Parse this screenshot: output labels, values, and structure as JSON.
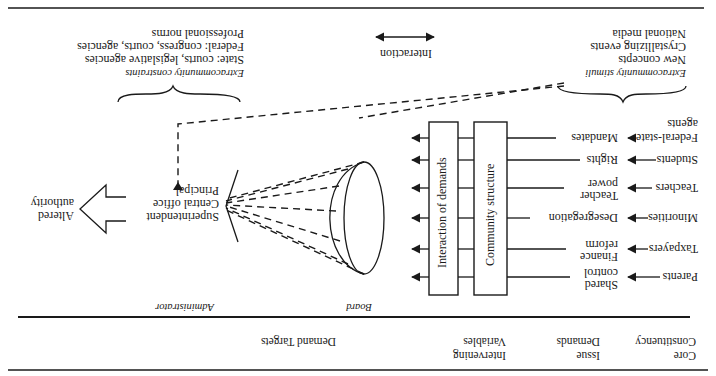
{
  "figure": {
    "orientation": "rotated-180",
    "headers": {
      "core_constituency": [
        "Core",
        "Constituency"
      ],
      "issue_demands": [
        "Issue",
        "Demands"
      ],
      "intervening_variables": [
        "Intervening",
        "Variables"
      ],
      "demand_targets": "Demand Targets"
    },
    "constituencies": [
      {
        "label": [
          "Parents"
        ]
      },
      {
        "label": [
          "Taxpayers"
        ]
      },
      {
        "label": [
          "Minorities"
        ]
      },
      {
        "label": [
          "Teachers"
        ]
      },
      {
        "label": [
          "Students"
        ]
      },
      {
        "label": [
          "Federal-state",
          "agents"
        ]
      }
    ],
    "issues": [
      {
        "label": [
          "Shared",
          "control"
        ]
      },
      {
        "label": [
          "Finance",
          "reform"
        ]
      },
      {
        "label": [
          "Desegregation"
        ]
      },
      {
        "label": [
          "Teacher",
          "power"
        ]
      },
      {
        "label": [
          "Rights"
        ]
      },
      {
        "label": [
          "Mandates"
        ]
      }
    ],
    "boxes": {
      "community_structure": "Community structure",
      "interaction_of_demands": "Interaction of demands"
    },
    "targets": {
      "board_label": "Board",
      "administrator_label": "Administrator",
      "administrator_roles": [
        "Superintendent",
        "Central office",
        "Principal"
      ],
      "outcome": [
        "Altered",
        "authority"
      ]
    },
    "extracommunity_stimuli": {
      "title": "Extracommunity stimuli",
      "items": [
        "New concepts",
        "Crystallizing events",
        "National media"
      ]
    },
    "extracommunity_constraints": {
      "title": "Extracommunity constraints",
      "items": [
        "State: courts, legislative agencies",
        "Federal: congress, courts, agencies",
        "Professional norms"
      ]
    },
    "legend": {
      "interaction": "Interaction"
    }
  }
}
